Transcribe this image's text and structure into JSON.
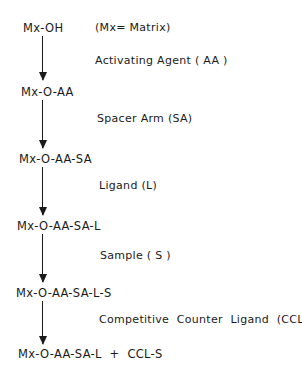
{
  "diagram": {
    "type": "affinity-chromatography-reaction-scheme",
    "note": "(Mx= Matrix)",
    "steps": [
      {
        "product": "Mx-OH"
      },
      {
        "reagent": "Activating Agent ( AA )",
        "product": "Mx-O-AA"
      },
      {
        "reagent": "Spacer Arm (SA)",
        "product": "Mx-O-AA-SA"
      },
      {
        "reagent": "Ligand (L)",
        "product": "Mx-O-AA-SA-L"
      },
      {
        "reagent": "Sample ( S )",
        "product": "Mx-O-AA-SA-L-S"
      },
      {
        "reagent": "Competitive  Counter  Ligand  (CCL)",
        "product": "Mx-O-AA-SA-L  +  CCL-S"
      }
    ],
    "colors": {
      "ink": "#1a1a1a",
      "background": "#ffffff"
    }
  }
}
